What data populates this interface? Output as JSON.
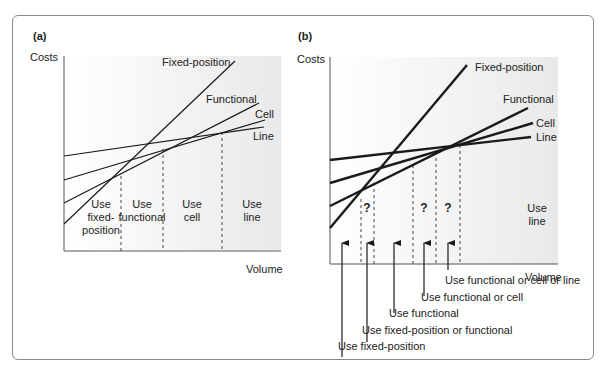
{
  "panels": [
    {
      "id": "a",
      "label": "(a)",
      "y_axis_label": "Costs",
      "x_axis_label": "Volume",
      "lines": [
        {
          "name": "Fixed-position"
        },
        {
          "name": "Functional"
        },
        {
          "name": "Cell"
        },
        {
          "name": "Line"
        }
      ],
      "regions": [
        {
          "lines": [
            "Use",
            "fixed-",
            "position"
          ]
        },
        {
          "lines": [
            "Use",
            "functional"
          ]
        },
        {
          "lines": [
            "Use",
            "cell"
          ]
        },
        {
          "lines": [
            "Use",
            "line"
          ]
        }
      ]
    },
    {
      "id": "b",
      "label": "(b)",
      "y_axis_label": "Costs",
      "x_axis_label": "Volume",
      "lines": [
        {
          "name": "Fixed-position"
        },
        {
          "name": "Functional"
        },
        {
          "name": "Cell"
        },
        {
          "name": "Line"
        }
      ],
      "uncertain_marker": "?",
      "region_label": [
        "Use",
        "line"
      ],
      "annotations": [
        "Use functional or cell or line",
        "Use functional or cell",
        "Use functional",
        "Use fixed-position or functional",
        "Use fixed-position"
      ]
    }
  ],
  "colors": {
    "line": "#1a1a1a",
    "plot_bg": "#f1f1f1",
    "frame": "#8a8a8a"
  }
}
